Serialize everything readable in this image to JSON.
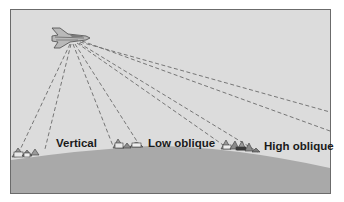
{
  "diagram": {
    "aircraft": {
      "icon": "jet-aircraft-icon",
      "position": [
        68,
        38
      ]
    },
    "labels": [
      {
        "id": "vertical",
        "text": "Vertical",
        "x": 56,
        "y": 138
      },
      {
        "id": "low-oblique",
        "text": "Low oblique",
        "x": 148,
        "y": 138
      },
      {
        "id": "high-oblique",
        "text": "High oblique",
        "x": 264,
        "y": 141
      }
    ],
    "sight_lines": [
      {
        "group": "vertical",
        "from": [
          70,
          44
        ],
        "to": [
          20,
          148
        ]
      },
      {
        "group": "vertical",
        "from": [
          71,
          44
        ],
        "to": [
          45,
          148
        ]
      },
      {
        "group": "low-oblique",
        "from": [
          73,
          44
        ],
        "to": [
          113,
          145
        ]
      },
      {
        "group": "low-oblique",
        "from": [
          75,
          44
        ],
        "to": [
          140,
          145
        ]
      },
      {
        "group": "high-oblique",
        "from": [
          77,
          43
        ],
        "to": [
          226,
          146
        ]
      },
      {
        "group": "high-oblique",
        "from": [
          79,
          43
        ],
        "to": [
          258,
          150
        ]
      },
      {
        "group": "horizon",
        "from": [
          80,
          42
        ],
        "to": [
          300,
          110
        ]
      },
      {
        "group": "horizon",
        "from": [
          82,
          41
        ],
        "to": [
          330,
          130
        ]
      }
    ],
    "house_clusters": [
      {
        "near": "vertical",
        "x": 14,
        "y": 146
      },
      {
        "near": "low-oblique",
        "x": 114,
        "y": 140
      },
      {
        "near": "high-oblique",
        "x": 222,
        "y": 141
      }
    ],
    "colors": {
      "sky": "#dcdcdc",
      "ground": "#a9a9a9",
      "frame_border": "#6b6b6b",
      "line": "#6a6a6a",
      "text": "#1a1a1a"
    }
  }
}
